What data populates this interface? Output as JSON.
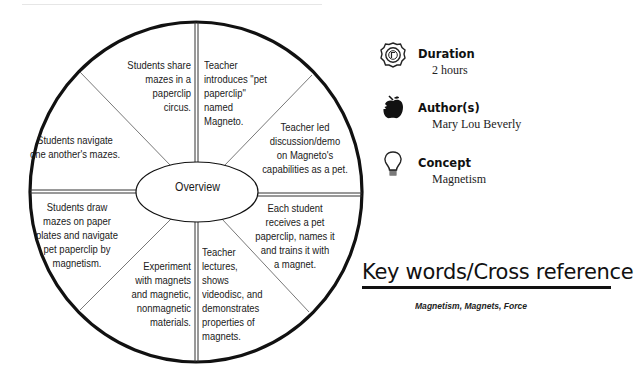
{
  "wheel": {
    "center_label": "Overview",
    "segments": [
      {
        "id": "top-right",
        "text": "Teacher\nintroduces \"pet\npaperclip\"\nnamed\nMagneto."
      },
      {
        "id": "upper-right",
        "text": "Teacher led\ndiscussion/demo\non Magneto's\ncapabilities as a pet."
      },
      {
        "id": "lower-right",
        "text": "Each student\nreceives a pet\npaperclip, names it\nand trains it with\na magnet."
      },
      {
        "id": "bottom-right",
        "text": "Teacher\nlectures,\nshows\nvideodisc, and\ndemonstrates\nproperties of\nmagnets."
      },
      {
        "id": "bottom-left",
        "text": "Experiment\nwith magnets\nand magnetic,\nnonmagnetic\nmaterials."
      },
      {
        "id": "lower-left",
        "text": "Students draw\nmazes on paper\nplates and navigate\npet paperclip by\nmagnetism."
      },
      {
        "id": "upper-left",
        "text": "Students navigate\none another's mazes."
      },
      {
        "id": "top-left",
        "text": "Students share\nmazes in a\npaperclip\ncircus."
      }
    ]
  },
  "info": {
    "duration": {
      "icon": "clock-icon",
      "label": "Duration",
      "value": "2 hours"
    },
    "authors": {
      "icon": "apple-icon",
      "label": "Author(s)",
      "value": "Mary Lou Beverly"
    },
    "concept": {
      "icon": "lightbulb-icon",
      "label": "Concept",
      "value": "Magnetism"
    }
  },
  "keywords": {
    "title": "Key words/Cross reference",
    "list": "Magnetism, Magnets, Force"
  }
}
